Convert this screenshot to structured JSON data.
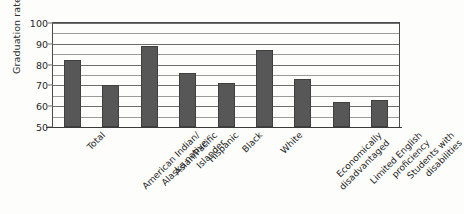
{
  "chart_data": {
    "type": "bar",
    "title": "",
    "xlabel": "",
    "ylabel": "Graduation rate",
    "ylim": [
      50,
      100
    ],
    "ytick_labels": [
      "50",
      "60",
      "70",
      "80",
      "90",
      "100"
    ],
    "ytick_values": [
      50,
      60,
      70,
      80,
      90,
      100
    ],
    "minor_gridline_values": [
      55,
      65,
      75,
      85,
      95
    ],
    "grid": "horizontal",
    "legend": "none",
    "bar_color": "#575757",
    "categories": [
      "Total",
      "American Indian/\nAlaska native",
      "Asian/Pacific\nIslander",
      "Hispanic",
      "Black",
      "White",
      "Economically\ndisadvantaged",
      "Limited English\nproficiency",
      "Students with\ndisabilities"
    ],
    "values": [
      82,
      70,
      89,
      76,
      71,
      87,
      73,
      62,
      63
    ]
  },
  "axis": {
    "y_title": "Graduation rate"
  }
}
